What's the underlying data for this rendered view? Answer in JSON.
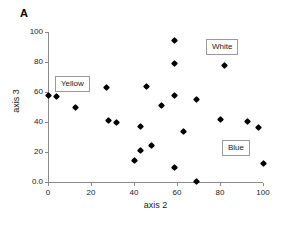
{
  "panel": {
    "letter": "A"
  },
  "chart_data": {
    "type": "scatter",
    "title": "",
    "xlabel": "axis 2",
    "ylabel": "axis 3",
    "xlim": [
      0,
      100
    ],
    "ylim": [
      0,
      100
    ],
    "grid": false,
    "legend_position": "inside-boxed-annotations",
    "xticks": [
      "0",
      "20",
      "40",
      "60",
      "80",
      "100"
    ],
    "xtick_values": [
      0,
      20,
      40,
      60,
      80,
      100
    ],
    "yticks": [
      "0.0",
      "20",
      "40",
      "60",
      "80",
      "100"
    ],
    "ytick_values": [
      0,
      20,
      40,
      60,
      80,
      100
    ],
    "marker": "filled-diamond",
    "marker_color": "#000000",
    "series": [
      {
        "name": "samples",
        "points": [
          {
            "x": 0,
            "y": 58
          },
          {
            "x": 4,
            "y": 57
          },
          {
            "x": 13,
            "y": 50
          },
          {
            "x": 27,
            "y": 63
          },
          {
            "x": 28,
            "y": 41
          },
          {
            "x": 32,
            "y": 40
          },
          {
            "x": 40,
            "y": 14.5
          },
          {
            "x": 43,
            "y": 37
          },
          {
            "x": 43,
            "y": 21
          },
          {
            "x": 46,
            "y": 64
          },
          {
            "x": 48,
            "y": 24.5
          },
          {
            "x": 53,
            "y": 51
          },
          {
            "x": 59,
            "y": 94.5
          },
          {
            "x": 59,
            "y": 79
          },
          {
            "x": 59,
            "y": 58
          },
          {
            "x": 59,
            "y": 9.5
          },
          {
            "x": 63,
            "y": 33.5
          },
          {
            "x": 69,
            "y": 55
          },
          {
            "x": 69,
            "y": 0.3
          },
          {
            "x": 80,
            "y": 41.5
          },
          {
            "x": 82,
            "y": 78
          },
          {
            "x": 93,
            "y": 40.5
          },
          {
            "x": 98,
            "y": 36.5
          },
          {
            "x": 100,
            "y": 12.5
          }
        ]
      }
    ],
    "annotations": [
      {
        "label": "Yellow",
        "x_px": 55,
        "y_px": 76
      },
      {
        "label": "White",
        "x_px": 206,
        "y_px": 39
      },
      {
        "label": "Blue",
        "x_px": 222,
        "y_px": 140
      }
    ]
  }
}
